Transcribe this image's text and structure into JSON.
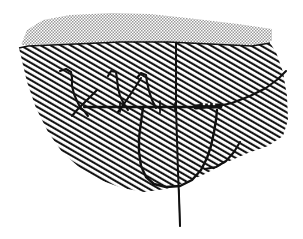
{
  "figure": {
    "background_color": "#ffffff",
    "width": 303,
    "height": 239,
    "ink_color": "#111111",
    "stipple_color": "#9a9a9a",
    "hatch_color": "#1a1a1a"
  },
  "regions": [
    {
      "name": "upper-stipple-band",
      "fill_style": "stipple-dots",
      "color": "#9a9a9a",
      "outline": "M 21,45 L 27,30 L 43,20 L 70,15 L 112,13 L 150,14 L 196,19 L 238,24 L 272,29 L 272,41 L 252,46 L 210,44 L 168,42 L 120,42 L 76,44 Z"
    },
    {
      "name": "lower-hatched-body",
      "fill_style": "diagonal-hatch",
      "color": "#1a1a1a",
      "outline": "M 19,48 L 28,46 L 76,44 L 120,42 L 168,42 L 210,44 L 252,46 L 270,43 L 276,52 L 283,72 L 287,96 L 288,120 L 283,136 L 268,146 L 248,153 L 225,163 L 205,174 L 186,182 L 166,189 L 144,192 L 122,188 L 100,180 L 80,168 L 62,152 L 48,132 L 36,108 L 27,82 Z"
    }
  ],
  "features": [
    {
      "name": "left-branch-hook",
      "type": "polyline",
      "path": "M 60,71 L 66,69 L 71,72 L 72,78 L 72,86 L 74,94 L 77,101 L 80,107"
    },
    {
      "name": "left-branch-lower-stem",
      "type": "polyline",
      "path": "M 80,107 L 85,112 L 88,116"
    },
    {
      "name": "left-branch-crossing-arm",
      "type": "polyline",
      "path": "M 97,90 L 90,97 L 83,104 L 77,110 L 72,116"
    },
    {
      "name": "mid-branch-hook",
      "type": "polyline",
      "path": "M 108,76 L 111,71 L 116,72 L 117,79 L 118,88 L 120,96 L 124,104 L 128,110"
    },
    {
      "name": "mid-branch-arm",
      "type": "polyline",
      "path": "M 141,78 L 136,86 L 130,95 L 124,104 L 118,112"
    },
    {
      "name": "right-branch-hook",
      "type": "polyline",
      "path": "M 137,78 L 141,73 L 146,75 L 147,82 L 149,91 L 152,100 L 156,108"
    },
    {
      "name": "horizontal-axis-line",
      "type": "polyline",
      "path": "M 84,107 L 124,107 L 160,107 L 196,107 L 214,107"
    },
    {
      "name": "horizontal-tick-left",
      "type": "polyline",
      "path": "M 120,102 L 120,112"
    },
    {
      "name": "horizontal-tick-mid",
      "type": "polyline",
      "path": "M 160,101 L 160,113"
    },
    {
      "name": "horizontal-tick-right",
      "type": "polyline",
      "path": "M 175,103 L 175,111"
    },
    {
      "name": "central-vertical-line",
      "type": "polyline",
      "path": "M 176,43 L 176,70 L 176,107 L 177,140 L 178,172 L 179,196 L 180,226"
    },
    {
      "name": "upper-right-boundary-curve",
      "type": "polyline",
      "path": "M 214,107 L 232,103 L 250,96 L 266,88 L 278,79 L 286,71"
    },
    {
      "name": "thick-marked-segment",
      "type": "polyline",
      "path": "M 196,107 L 206,106 L 214,106 L 220,106"
    },
    {
      "name": "marked-segment-dots",
      "type": "dots",
      "points": [
        [
          204,
          104
        ],
        [
          209,
          104
        ],
        [
          214,
          104
        ]
      ]
    },
    {
      "name": "lower-closed-loop",
      "type": "polyline",
      "path": "M 143,108 L 141,122 L 139,138 L 139,152 L 141,166 L 146,177 L 154,184 L 166,187 L 180,186 L 192,180 L 201,170 L 207,158 L 211,146 L 214,132 L 216,120 L 217,110"
    },
    {
      "name": "loop-right-shoulder",
      "type": "polyline",
      "path": "M 205,169 L 216,167 L 226,161 L 234,152 L 240,142"
    }
  ],
  "annotations": []
}
